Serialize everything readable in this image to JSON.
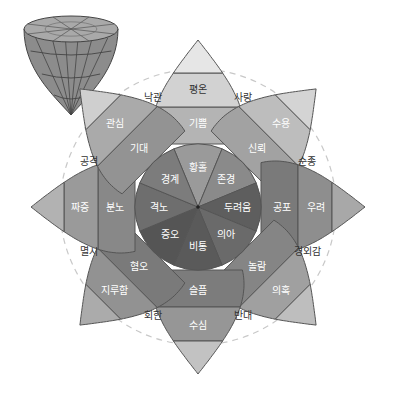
{
  "diagram": {
    "center": {
      "x": 198,
      "y": 207
    },
    "radii": {
      "inner": 63,
      "middle": 100,
      "outer": 134,
      "tip": 167,
      "dash_inner": 95,
      "dash_outer": 138
    },
    "petals": [
      {
        "angle": -90,
        "inner": "황홀",
        "middle": "기쁨",
        "outer": "평온",
        "shades": [
          "#9a9a9a",
          "#b4b4b4",
          "#d2d2d2",
          "#e6e6e6"
        ]
      },
      {
        "angle": -45,
        "inner": "존경",
        "middle": "신뢰",
        "outer": "수용",
        "shades": [
          "#8a8a8a",
          "#a2a2a2",
          "#bdbdbd",
          "#d4d4d4"
        ]
      },
      {
        "angle": 0,
        "inner": "두려움",
        "middle": "공포",
        "outer": "우려",
        "shades": [
          "#5e5e5e",
          "#7a7a7a",
          "#8e8e8e",
          "#a8a8a8"
        ]
      },
      {
        "angle": 45,
        "inner": "의아",
        "middle": "놀람",
        "outer": "의혹",
        "shades": [
          "#6a6a6a",
          "#858585",
          "#a0a0a0",
          "#bebebe"
        ]
      },
      {
        "angle": 90,
        "inner": "비통",
        "middle": "슬픔",
        "outer": "수심",
        "shades": [
          "#5a5a5a",
          "#7c7c7c",
          "#969696",
          "#c2c2c2"
        ]
      },
      {
        "angle": 135,
        "inner": "증오",
        "middle": "혐오",
        "outer": "지루함",
        "shades": [
          "#555555",
          "#7a7a7a",
          "#929292",
          "#ababab"
        ]
      },
      {
        "angle": 180,
        "inner": "격노",
        "middle": "분노",
        "outer": "짜증",
        "shades": [
          "#6e6e6e",
          "#888888",
          "#9a9a9a",
          "#b2b2b2"
        ]
      },
      {
        "angle": -135,
        "inner": "경계",
        "middle": "기대",
        "outer": "관심",
        "shades": [
          "#7c7c7c",
          "#939393",
          "#aaaaaa",
          "#cfcfcf"
        ]
      }
    ],
    "dyads": [
      {
        "angle": -112.5,
        "label": "낙관"
      },
      {
        "angle": -67.5,
        "label": "사랑"
      },
      {
        "angle": -22.5,
        "label": "순종"
      },
      {
        "angle": 22.5,
        "label": "경외감"
      },
      {
        "angle": 67.5,
        "label": "반대"
      },
      {
        "angle": 112.5,
        "label": "회한"
      },
      {
        "angle": 157.5,
        "label": "멸시"
      },
      {
        "angle": -157.5,
        "label": "공격"
      }
    ],
    "colors": {
      "outline": "#555555",
      "dash": "#c8c8c8",
      "background": "#ffffff"
    },
    "cone": {
      "cx": 71,
      "top_y": 29,
      "tip_y": 115,
      "rx": 47,
      "ry": 13
    }
  }
}
